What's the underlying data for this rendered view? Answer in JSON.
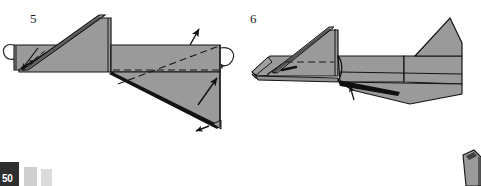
{
  "page": {
    "number": "50",
    "background_color": "#ffffff",
    "width": 481,
    "height": 186
  },
  "diagram": {
    "type": "origami-step-diagram",
    "paper_fill": "#9a9a9a",
    "paper_fill_light": "#a8a8a8",
    "paper_fill_dark": "#8c8c8c",
    "outline_color": "#141414",
    "shadow_color": "#111111",
    "dash_color": "#1a1a1a"
  },
  "steps": [
    {
      "id": "step-5",
      "number": "5",
      "label": "Step 5",
      "description": "Flattened model with valley fold line across right flap; rotate arrows at both ends and fold arrows indicating the right point is swung up and the lower flap pulled out.",
      "annotations": [
        {
          "name": "rotation-arrow-left",
          "kind": "loop-arrow"
        },
        {
          "name": "rotation-arrow-right",
          "kind": "loop-arrow"
        },
        {
          "name": "fold-arrow-up-right",
          "kind": "straight-arrow"
        },
        {
          "name": "fold-arrow-inner-right",
          "kind": "straight-arrow"
        },
        {
          "name": "fold-arrow-bottom-tip",
          "kind": "straight-arrow"
        },
        {
          "name": "fold-arrow-left-inner",
          "kind": "straight-arrow"
        },
        {
          "name": "dashed-fold-line-horizontal",
          "kind": "valley-fold-dash"
        },
        {
          "name": "dashed-fold-line-diagonal",
          "kind": "valley-fold-dash"
        }
      ]
    },
    {
      "id": "step-6",
      "number": "6",
      "label": "Step 6",
      "description": "Result of step 5: the model is now elongated with a raised triangular fin on the right and a long tapering tail; an arrow points up at the lower notch.",
      "annotations": [
        {
          "name": "dashed-fold-line-horizontal",
          "kind": "valley-fold-dash"
        },
        {
          "name": "fold-arrow-up-notch",
          "kind": "straight-arrow"
        },
        {
          "name": "crease-mark-short",
          "kind": "crease-tick"
        }
      ]
    }
  ],
  "bottom_tabs": [
    {
      "name": "page-number-tab",
      "color": "#2e2e2e",
      "label": "50"
    },
    {
      "name": "secondary-tab",
      "color": "#cfcfcf",
      "label": ""
    },
    {
      "name": "tertiary-tab",
      "color": "#dcdcdc",
      "label": ""
    }
  ],
  "corner_figure": {
    "name": "next-step-partial-figure",
    "description": "Top sliver of the next diagram cropped by the page edge at bottom right."
  }
}
